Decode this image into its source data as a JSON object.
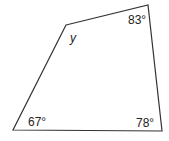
{
  "figure": {
    "type": "quadrilateral",
    "stroke_color": "#333333",
    "vertices": {
      "top_left": [
        66,
        25
      ],
      "top_right": [
        148,
        5
      ],
      "bottom_right": [
        162,
        131
      ],
      "bottom_left": [
        13,
        130
      ]
    },
    "angles": {
      "top_left": "y",
      "top_right": "83°",
      "bottom_right": "78°",
      "bottom_left": "67°"
    }
  }
}
